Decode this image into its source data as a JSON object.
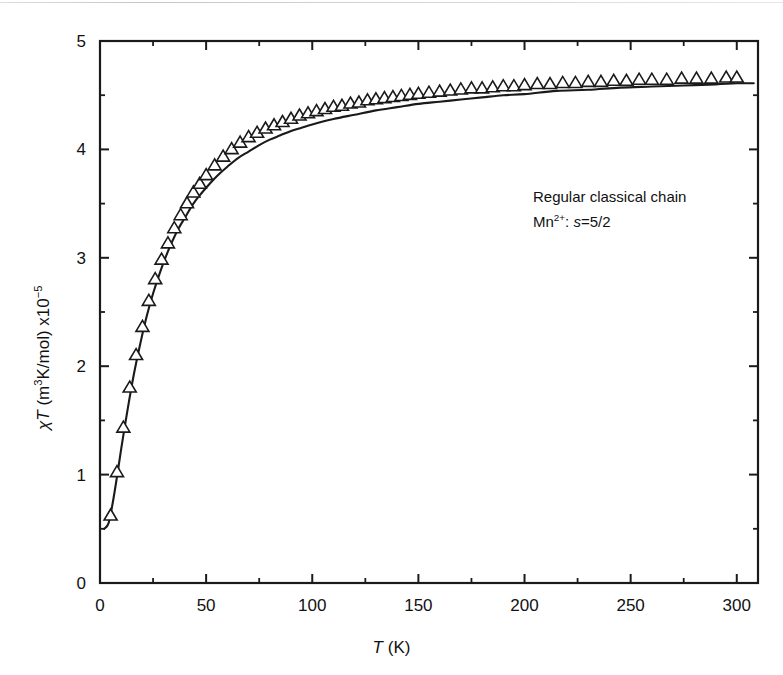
{
  "figure": {
    "background": "#ffffff",
    "ink_color": "#1a1a1a"
  },
  "axes": {
    "x_title_main": "T",
    "x_title_unit": " (K)",
    "y_title_symbol": "χT",
    "y_title_unit_pre": " (m",
    "y_title_unit_sup": "3",
    "y_title_unit_post": "K/mol) x10",
    "y_title_exp": "−5"
  },
  "annotations": {
    "line1": "Regular classical chain",
    "line2_ion": "Mn",
    "line2_charge": "2+",
    "line2_mid": ": ",
    "line2_s": "s",
    "line2_val": "=5/2"
  },
  "chart_data": {
    "type": "line",
    "title": "",
    "xlabel": "T (K)",
    "ylabel": "χT (m3K/mol) x10−5",
    "xlim": [
      0,
      310
    ],
    "ylim": [
      0,
      5
    ],
    "xticks": [
      0,
      50,
      100,
      150,
      200,
      250,
      300
    ],
    "xticklabels": [
      "0",
      "50",
      "100",
      "150",
      "200",
      "250",
      "300"
    ],
    "x_minor_ticks": [
      25,
      75,
      125,
      175,
      225,
      275
    ],
    "yticks": [
      0,
      1,
      2,
      3,
      4,
      5
    ],
    "yticklabels": [
      "0",
      "1",
      "2",
      "3",
      "4",
      "5"
    ],
    "y_minor_ticks": [
      0.5,
      1.5,
      2.5,
      3.5,
      4.5
    ],
    "grid": false,
    "legend": null,
    "tick_direction": "in",
    "frame": "box",
    "series": [
      {
        "name": "experimental data",
        "marker": "open-triangle-up",
        "linestyle": "none",
        "x": [
          5,
          8,
          11,
          14,
          17,
          20,
          23,
          26,
          29,
          32,
          35,
          38,
          41,
          44,
          47,
          50,
          54,
          58,
          62,
          66,
          70,
          74,
          78,
          82,
          86,
          90,
          94,
          98,
          102,
          106,
          110,
          114,
          118,
          122,
          126,
          130,
          134,
          138,
          142,
          146,
          150,
          155,
          160,
          165,
          170,
          175,
          180,
          185,
          190,
          195,
          200,
          206,
          212,
          218,
          224,
          230,
          236,
          242,
          248,
          254,
          260,
          267,
          274,
          281,
          288,
          295,
          300
        ],
        "y": [
          0.62,
          1.02,
          1.43,
          1.8,
          2.1,
          2.36,
          2.6,
          2.8,
          2.98,
          3.13,
          3.27,
          3.39,
          3.5,
          3.6,
          3.68,
          3.76,
          3.85,
          3.93,
          4.0,
          4.06,
          4.11,
          4.15,
          4.19,
          4.22,
          4.25,
          4.28,
          4.31,
          4.33,
          4.35,
          4.37,
          4.39,
          4.4,
          4.42,
          4.43,
          4.45,
          4.46,
          4.47,
          4.48,
          4.49,
          4.5,
          4.51,
          4.52,
          4.53,
          4.54,
          4.55,
          4.56,
          4.56,
          4.57,
          4.58,
          4.58,
          4.59,
          4.6,
          4.6,
          4.61,
          4.61,
          4.62,
          4.62,
          4.63,
          4.63,
          4.64,
          4.64,
          4.64,
          4.65,
          4.65,
          4.65,
          4.66,
          4.66
        ]
      },
      {
        "name": "classical chain fit",
        "marker": "none",
        "linestyle": "solid",
        "x": [
          2,
          4,
          6,
          8,
          10,
          13,
          16,
          19,
          22,
          25,
          28,
          31,
          34,
          37,
          40,
          44,
          48,
          52,
          56,
          60,
          65,
          70,
          75,
          80,
          85,
          90,
          95,
          100,
          110,
          120,
          130,
          140,
          150,
          160,
          170,
          180,
          190,
          200,
          215,
          230,
          245,
          260,
          275,
          290,
          300,
          308
        ],
        "y": [
          0.5,
          0.55,
          0.74,
          0.98,
          1.24,
          1.6,
          1.93,
          2.21,
          2.46,
          2.67,
          2.85,
          3.01,
          3.15,
          3.27,
          3.37,
          3.5,
          3.6,
          3.69,
          3.77,
          3.84,
          3.92,
          3.98,
          4.04,
          4.09,
          4.13,
          4.17,
          4.2,
          4.23,
          4.28,
          4.32,
          4.36,
          4.39,
          4.42,
          4.44,
          4.46,
          4.48,
          4.5,
          4.51,
          4.54,
          4.55,
          4.57,
          4.58,
          4.59,
          4.6,
          4.61,
          4.61
        ]
      }
    ]
  }
}
